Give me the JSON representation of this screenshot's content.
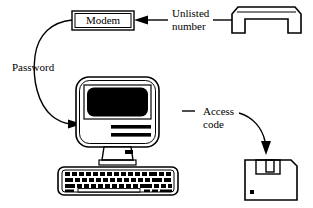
{
  "figure": {
    "background_color": "#ffffff",
    "ink_color": "#000000"
  },
  "nodes": {
    "modem": {
      "label": "Modem",
      "shape": "double-bordered-rectangle",
      "x": 72,
      "y": 11,
      "width": 62,
      "height": 19
    },
    "telephone_handset": {
      "icon": "telephone-handset-icon",
      "shape": "handset-outline",
      "x": 226,
      "y": 8,
      "width": 80,
      "height": 26
    },
    "computer": {
      "icon": "desktop-computer-icon",
      "shape": "all-in-one-computer",
      "x": 76,
      "y": 77,
      "width": 83,
      "height": 70,
      "screen_color": "#000000",
      "drive_slots": 2
    },
    "keyboard": {
      "icon": "keyboard-icon",
      "shape": "keyboard-outline",
      "x": 58,
      "y": 167,
      "width": 120,
      "height": 28,
      "key_rows": 4
    },
    "floppy_disk": {
      "icon": "floppy-disk-icon",
      "shape": "floppy-3-5-inch",
      "x": 245,
      "y": 152,
      "width": 52,
      "height": 48
    }
  },
  "annotations": [
    {
      "id": "unlisted-number",
      "lines": [
        "Unlisted",
        "number"
      ],
      "text": "Unlisted number",
      "target": "modem",
      "connector": "leader-line-with-arrow",
      "arrow_direction": "left"
    },
    {
      "id": "password",
      "lines": [
        "Password"
      ],
      "text": "Password",
      "target": "computer",
      "connector": "curved-arrow",
      "arrow_direction": "down-right"
    },
    {
      "id": "access-code",
      "lines": [
        "Access",
        "code"
      ],
      "text": "Access code",
      "target": "floppy_disk",
      "connector": "curved-arrow",
      "arrow_direction": "down"
    }
  ],
  "text_positions": {
    "unlisted_line1": {
      "x": 172,
      "y": 14
    },
    "unlisted_line2": {
      "x": 172,
      "y": 27
    },
    "password": {
      "x": 12,
      "y": 68
    },
    "access_line1": {
      "x": 203,
      "y": 112
    },
    "access_line2": {
      "x": 203,
      "y": 125
    }
  }
}
